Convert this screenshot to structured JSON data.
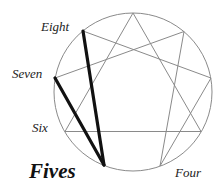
{
  "diagram": {
    "type": "enneagram",
    "circle": {
      "cx": 133,
      "cy": 92,
      "r": 79,
      "stroke": "#8a8a8a"
    },
    "points": {
      "9": [
        133,
        13
      ],
      "1": [
        184,
        31.5
      ],
      "2": [
        211,
        78
      ],
      "3": [
        201,
        131.5
      ],
      "4": [
        160,
        166
      ],
      "5": [
        104,
        165
      ],
      "6": [
        65,
        131.5
      ],
      "7": [
        55,
        78
      ],
      "8": [
        83,
        31
      ]
    },
    "thin_lines_color": "#8a8a8a",
    "thick_lines_color": "#111111",
    "thick_lines": [
      [
        "8",
        "5"
      ],
      [
        "7",
        "5"
      ]
    ],
    "labels": {
      "eight": "Eight",
      "seven": "Seven",
      "six": "Six",
      "fives": "Fives",
      "four": "Four"
    }
  }
}
